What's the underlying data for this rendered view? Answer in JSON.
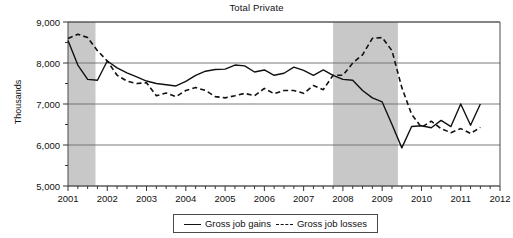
{
  "chart_data": {
    "type": "line",
    "title": "Total Private",
    "xlabel": "",
    "ylabel": "Thousands",
    "xlim": [
      2001,
      2012
    ],
    "ylim": [
      5000,
      9000
    ],
    "y_ticks": [
      "5,000",
      "6,000",
      "7,000",
      "8,000",
      "9,000"
    ],
    "y_tick_values": [
      5000,
      6000,
      7000,
      8000,
      9000
    ],
    "y_minor_tick_values": [
      5500,
      6500,
      7500,
      8500
    ],
    "x_ticks": [
      "2001",
      "2002",
      "2003",
      "2004",
      "2005",
      "2006",
      "2007",
      "2008",
      "2009",
      "2010",
      "2011",
      "2012"
    ],
    "x_tick_values": [
      2001,
      2002,
      2003,
      2004,
      2005,
      2006,
      2007,
      2008,
      2009,
      2010,
      2011,
      2012
    ],
    "x_minor_tick_step": 0.25,
    "grid": "horizontal",
    "legend_position": "bottom",
    "shaded_bands": [
      {
        "label": "recession-band-2001",
        "x0": 2001.0,
        "x1": 2001.7,
        "color": "#c8c8c8"
      },
      {
        "label": "recession-band-2008",
        "x0": 2007.75,
        "x1": 2009.4,
        "color": "#c8c8c8"
      }
    ],
    "series": [
      {
        "name": "Gross job gains",
        "style": "solid",
        "color": "#111111",
        "x": [
          2001.0,
          2001.25,
          2001.5,
          2001.75,
          2002.0,
          2002.25,
          2002.5,
          2002.75,
          2003.0,
          2003.25,
          2003.5,
          2003.75,
          2004.0,
          2004.25,
          2004.5,
          2004.75,
          2005.0,
          2005.25,
          2005.5,
          2005.75,
          2006.0,
          2006.25,
          2006.5,
          2006.75,
          2007.0,
          2007.25,
          2007.5,
          2007.75,
          2008.0,
          2008.25,
          2008.5,
          2008.75,
          2009.0,
          2009.25,
          2009.5,
          2009.75,
          2010.0,
          2010.25,
          2010.5,
          2010.75,
          2011.0,
          2011.25,
          2011.5
        ],
        "values": [
          8550,
          7950,
          7600,
          7580,
          8050,
          7880,
          7760,
          7660,
          7560,
          7500,
          7470,
          7440,
          7550,
          7700,
          7800,
          7840,
          7850,
          7950,
          7930,
          7780,
          7830,
          7700,
          7750,
          7900,
          7820,
          7700,
          7830,
          7700,
          7600,
          7580,
          7330,
          7150,
          7050,
          6500,
          5930,
          6450,
          6470,
          6420,
          6600,
          6450,
          7000,
          6480,
          7000
        ]
      },
      {
        "name": "Gross job losses",
        "style": "dashed",
        "color": "#111111",
        "x": [
          2001.0,
          2001.25,
          2001.5,
          2001.75,
          2002.0,
          2002.25,
          2002.5,
          2002.75,
          2003.0,
          2003.25,
          2003.5,
          2003.75,
          2004.0,
          2004.25,
          2004.5,
          2004.75,
          2005.0,
          2005.25,
          2005.5,
          2005.75,
          2006.0,
          2006.25,
          2006.5,
          2006.75,
          2007.0,
          2007.25,
          2007.5,
          2007.75,
          2008.0,
          2008.25,
          2008.5,
          2008.75,
          2009.0,
          2009.25,
          2009.5,
          2009.75,
          2010.0,
          2010.25,
          2010.5,
          2010.75,
          2011.0,
          2011.25,
          2011.5
        ],
        "values": [
          8600,
          8700,
          8620,
          8300,
          8050,
          7700,
          7560,
          7500,
          7520,
          7200,
          7270,
          7180,
          7330,
          7400,
          7330,
          7180,
          7150,
          7200,
          7260,
          7200,
          7380,
          7250,
          7330,
          7330,
          7260,
          7450,
          7350,
          7700,
          7700,
          8000,
          8200,
          8600,
          8620,
          8300,
          7400,
          6750,
          6430,
          6580,
          6400,
          6300,
          6400,
          6280,
          6430
        ]
      }
    ]
  },
  "legend": {
    "items": [
      {
        "label": "Gross job gains",
        "style": "solid"
      },
      {
        "label": "Gross job losses",
        "style": "dashed"
      }
    ]
  }
}
